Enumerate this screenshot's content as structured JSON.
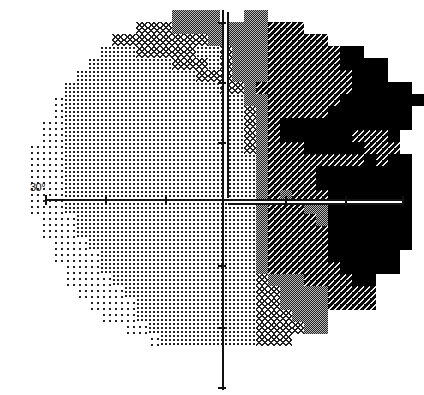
{
  "chart_data": {
    "type": "heatmap",
    "title": "",
    "axis_label": "30°",
    "xlabel": "",
    "ylabel": "",
    "extent_degrees": 30,
    "tick_spacing_px": 60,
    "tone_legend": [
      "sparse dots (normal)",
      "dots",
      "crosshatch",
      "fine checker",
      "dark with white dashes",
      "solid black (absolute defect)"
    ],
    "grid": {
      "cell_px": 12,
      "origin_x": 4,
      "origin_y": 10,
      "rows": [
        "..............3333..33..............",
        "...........22233333333444...........",
        ".........222222223333344444.........",
        "........1112222211233344444455......",
        ".......1111111222123334444445555.....",
        "......11111111112223334444444555....",
        ".....11111111111112234444444455555..",
        "....0111111111111111334444445555555.",
        "....011111111111111123444445555555..",
        "...0011111111111111123455555555555..",
        "...001111111111111112345555554445...",
        "..0001111111111111112344455555444...",
        "..00011111111111111113444444445455..",
        "..00011111111111111113444455555555..",
        "..00011111111111111113444455555555..",
        "..00011111111111111113434445555555..",
        "..00011111111111111113444335555555..",
        "...0001111111111111113444435555555..",
        "...0001111111111111113444445555555..",
        "....000111111111111113444445555555..",
        "....00001111111111111344444555555...",
        ".....0001111111111111344444455555...",
        ".....00001111111111112333444455.....",
        "......0000111111111112233334444.....",
        ".......000011111111112233334444.....",
        "........0001111111111222333.........",
        "..........00111111111222233.........",
        "............011111111222............",
        "..............................."
      ]
    }
  }
}
